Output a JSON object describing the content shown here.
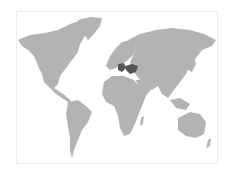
{
  "map": {
    "type": "world-choropleth",
    "colors": {
      "land": "#b3b3b3",
      "highlight": "#555555",
      "background": "#ffffff",
      "frame": "#ececec"
    },
    "highlighted_regions": [
      "Greece",
      "Turkey"
    ]
  }
}
